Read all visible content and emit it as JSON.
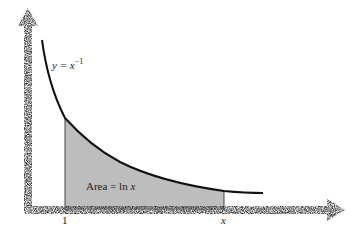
{
  "figure": {
    "curve_label_prefix": "y = x",
    "curve_label_exponent": "−1",
    "area_label": "Area = ln ",
    "area_label_var": "x",
    "x_tick_1": "1",
    "x_tick_x": "x"
  },
  "colors": {
    "curve": "#111111",
    "shaded_area": "#bdbdbd",
    "axes": "#555555"
  }
}
